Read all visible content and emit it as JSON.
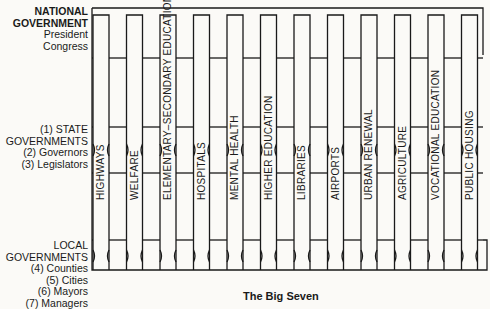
{
  "levels": {
    "national": {
      "title_lines": [
        "NATIONAL",
        "GOVERNMENT"
      ],
      "sub_lines": [
        "President",
        "Congress"
      ]
    },
    "state": {
      "title_lines": [
        "(1) STATE",
        "GOVERNMENTS"
      ],
      "sub_lines": [
        "(2) Governors",
        "(3) Legislators"
      ]
    },
    "local": {
      "title_lines": [
        "LOCAL",
        "GOVERNMENTS"
      ],
      "sub_lines": [
        "(4) Counties",
        "(5) Cities",
        "(6) Mayors",
        "(7) Managers"
      ]
    }
  },
  "programs": [
    "HIGHWAYS",
    "WELFARE",
    "ELEMENTARY–SECONDARY EDUCATION",
    "HOSPITALS",
    "MENTAL HEALTH",
    "HIGHER EDUCATION",
    "LIBRARIES",
    "AIRPORTS",
    "URBAN RENEWAL",
    "AGRICULTURE",
    "VOCATIONAL EDUCATION",
    "PUBLIC HOUSING"
  ],
  "caption": "The Big Seven",
  "colors": {
    "line": "#1a1a1a",
    "background": "#fbfaf7"
  }
}
